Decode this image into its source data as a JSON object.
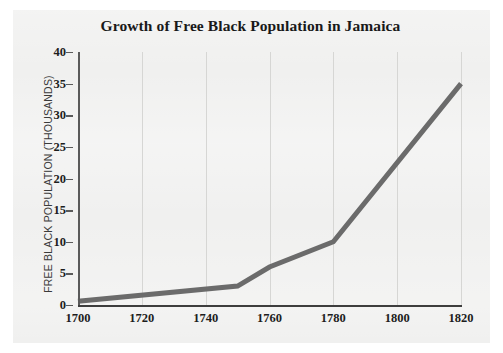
{
  "chart_data": {
    "type": "line",
    "title": "Growth of Free Black Population in Jamaica",
    "xlabel": "",
    "ylabel": "FREE BLACK POPULATION (THOUSANDS)",
    "x": [
      1700,
      1750,
      1760,
      1780,
      1820
    ],
    "values": [
      0.6,
      3,
      6,
      10,
      35
    ],
    "series": [
      {
        "name": "Free Black Population",
        "points": [
          {
            "year": 1700,
            "value": 0.6
          },
          {
            "year": 1750,
            "value": 3
          },
          {
            "year": 1760,
            "value": 6
          },
          {
            "year": 1780,
            "value": 10
          },
          {
            "year": 1820,
            "value": 35
          }
        ]
      }
    ],
    "xlim": [
      1700,
      1820
    ],
    "ylim": [
      0,
      40
    ],
    "xticks": [
      1700,
      1720,
      1740,
      1760,
      1780,
      1800,
      1820
    ],
    "yticks": [
      0,
      5,
      10,
      15,
      20,
      25,
      30,
      35,
      40
    ],
    "xtick_labels": [
      "1700",
      "1720",
      "1740",
      "1760",
      "1780",
      "1800",
      "1820"
    ],
    "ytick_labels": [
      "0",
      "5",
      "10",
      "15",
      "20",
      "25",
      "30",
      "35",
      "40"
    ],
    "grid": {
      "vertical": true,
      "horizontal": false
    },
    "legend": null,
    "colors": {
      "line": "#6b6b6b",
      "axis": "#3d3d3d",
      "gridline": "#d6d6d4",
      "background": "#f0f0ef",
      "text": "#1d1d1d"
    },
    "line_width": 5
  }
}
